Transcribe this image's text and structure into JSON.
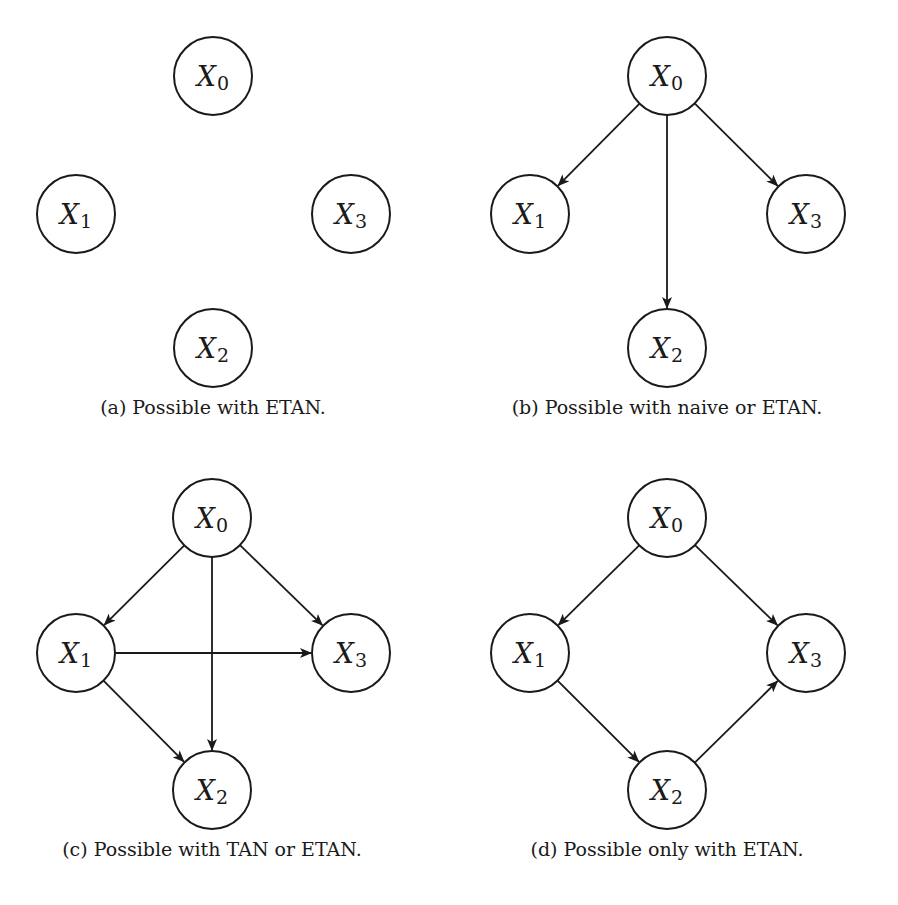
{
  "figure": {
    "colors": {
      "stroke": "#1a1a1a",
      "background": "#ffffff"
    },
    "node_radius": 39,
    "panels": [
      {
        "id": "a",
        "caption": "(a) Possible with ETAN.",
        "caption_pos": [
          213,
          396
        ],
        "nodes": [
          {
            "id": "X0",
            "var": "X",
            "sub": "0",
            "x": 213,
            "y": 76
          },
          {
            "id": "X1",
            "var": "X",
            "sub": "1",
            "x": 76,
            "y": 214
          },
          {
            "id": "X3",
            "var": "X",
            "sub": "3",
            "x": 351,
            "y": 214
          },
          {
            "id": "X2",
            "var": "X",
            "sub": "2",
            "x": 213,
            "y": 348
          }
        ],
        "edges": []
      },
      {
        "id": "b",
        "caption": "(b) Possible with naive or ETAN.",
        "caption_pos": [
          667,
          396
        ],
        "nodes": [
          {
            "id": "X0",
            "var": "X",
            "sub": "0",
            "x": 667,
            "y": 76
          },
          {
            "id": "X1",
            "var": "X",
            "sub": "1",
            "x": 530,
            "y": 214
          },
          {
            "id": "X3",
            "var": "X",
            "sub": "3",
            "x": 806,
            "y": 214
          },
          {
            "id": "X2",
            "var": "X",
            "sub": "2",
            "x": 667,
            "y": 348
          }
        ],
        "edges": [
          [
            "X0",
            "X1"
          ],
          [
            "X0",
            "X3"
          ],
          [
            "X0",
            "X2"
          ]
        ]
      },
      {
        "id": "c",
        "caption": "(c) Possible with TAN or ETAN.",
        "caption_pos": [
          212,
          838
        ],
        "nodes": [
          {
            "id": "X0",
            "var": "X",
            "sub": "0",
            "x": 212,
            "y": 518
          },
          {
            "id": "X1",
            "var": "X",
            "sub": "1",
            "x": 76,
            "y": 653
          },
          {
            "id": "X3",
            "var": "X",
            "sub": "3",
            "x": 351,
            "y": 653
          },
          {
            "id": "X2",
            "var": "X",
            "sub": "2",
            "x": 212,
            "y": 790
          }
        ],
        "edges": [
          [
            "X0",
            "X1"
          ],
          [
            "X0",
            "X3"
          ],
          [
            "X0",
            "X2"
          ],
          [
            "X1",
            "X3"
          ],
          [
            "X1",
            "X2"
          ]
        ]
      },
      {
        "id": "d",
        "caption": "(d) Possible only with ETAN.",
        "caption_pos": [
          667,
          838
        ],
        "nodes": [
          {
            "id": "X0",
            "var": "X",
            "sub": "0",
            "x": 667,
            "y": 518
          },
          {
            "id": "X1",
            "var": "X",
            "sub": "1",
            "x": 530,
            "y": 653
          },
          {
            "id": "X3",
            "var": "X",
            "sub": "3",
            "x": 806,
            "y": 653
          },
          {
            "id": "X2",
            "var": "X",
            "sub": "2",
            "x": 667,
            "y": 790
          }
        ],
        "edges": [
          [
            "X0",
            "X1"
          ],
          [
            "X0",
            "X3"
          ],
          [
            "X1",
            "X2"
          ],
          [
            "X2",
            "X3"
          ]
        ]
      }
    ]
  }
}
